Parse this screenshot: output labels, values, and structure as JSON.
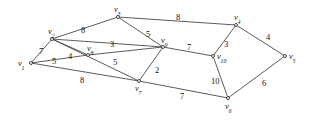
{
  "figure": {
    "type": "weighted-undirected-graph",
    "background_color": "#ffffff",
    "edge_color": "#4a4a4a",
    "label_color": "#111111",
    "width": 311,
    "height": 120
  },
  "chart_data": {
    "type": "diagram",
    "title": "",
    "xlabel": "",
    "ylabel": "",
    "graph_kind": "weighted undirected graph",
    "vertex_count": 10,
    "edge_count": 17,
    "vertices": [
      {
        "id": "v1",
        "label": "v",
        "sub": "1",
        "x": 31,
        "y": 63
      },
      {
        "id": "v2",
        "label": "v",
        "sub": "2",
        "x": 52,
        "y": 39
      },
      {
        "id": "v3",
        "label": "v",
        "sub": "3",
        "x": 118,
        "y": 17
      },
      {
        "id": "v4",
        "label": "v",
        "sub": "4",
        "x": 236,
        "y": 25
      },
      {
        "id": "v5",
        "label": "v",
        "sub": "5",
        "x": 285,
        "y": 56
      },
      {
        "id": "v6",
        "label": "v",
        "sub": "6",
        "x": 228,
        "y": 98
      },
      {
        "id": "v7",
        "label": "v",
        "sub": "7",
        "x": 139,
        "y": 81
      },
      {
        "id": "v8",
        "label": "v",
        "sub": "8",
        "x": 88,
        "y": 55
      },
      {
        "id": "v9",
        "label": "v",
        "sub": "9",
        "x": 163,
        "y": 47
      },
      {
        "id": "v10",
        "label": "v",
        "sub": "10",
        "x": 213,
        "y": 56
      }
    ],
    "vertex_label_offsets": {
      "v1": {
        "dx": -13,
        "dy": -4
      },
      "v2": {
        "dx": -4,
        "dy": -12
      },
      "v3": {
        "dx": -4,
        "dy": -12
      },
      "v4": {
        "dx": -2,
        "dy": -12
      },
      "v5": {
        "dx": 4,
        "dy": -4
      },
      "v6": {
        "dx": -3,
        "dy": 4
      },
      "v7": {
        "dx": -4,
        "dy": 3
      },
      "v8": {
        "dx": -1,
        "dy": -11
      },
      "v9": {
        "dx": -2,
        "dy": -11
      },
      "v10": {
        "dx": 4,
        "dy": -4
      }
    },
    "edges": [
      {
        "from": "v1",
        "to": "v2",
        "weight": 7,
        "lx": 39,
        "ly": 47
      },
      {
        "from": "v1",
        "to": "v8",
        "weight": 5,
        "lx": 52,
        "ly": 57
      },
      {
        "from": "v1",
        "to": "v7",
        "weight": 8,
        "lx": 80,
        "ly": 76
      },
      {
        "from": "v2",
        "to": "v3",
        "weight": 8,
        "lx": 81,
        "ly": 26
      },
      {
        "from": "v2",
        "to": "v8",
        "weight": 4,
        "lx": 68,
        "ly": 52
      },
      {
        "from": "v2",
        "to": "v9",
        "weight": 3,
        "lx": 110,
        "ly": 40
      },
      {
        "from": "v2",
        "to": "v7",
        "weight": 5,
        "lx": 113,
        "ly": 58
      },
      {
        "from": "v3",
        "to": "v9",
        "weight": 5,
        "lx": 146,
        "ly": 30
      },
      {
        "from": "v3",
        "to": "v4",
        "weight": 8,
        "lx": 176,
        "ly": 13
      },
      {
        "from": "v8",
        "to": "v9",
        "weight": null,
        "lx": null,
        "ly": null
      },
      {
        "from": "v9",
        "to": "v7",
        "weight": 2,
        "lx": 155,
        "ly": 66
      },
      {
        "from": "v9",
        "to": "v10",
        "weight": 7,
        "lx": 187,
        "ly": 43
      },
      {
        "from": "v4",
        "to": "v10",
        "weight": 3,
        "lx": 224,
        "ly": 40
      },
      {
        "from": "v4",
        "to": "v5",
        "weight": 4,
        "lx": 266,
        "ly": 33
      },
      {
        "from": "v10",
        "to": "v6",
        "weight": 10,
        "lx": 211,
        "ly": 77
      },
      {
        "from": "v7",
        "to": "v6",
        "weight": 7,
        "lx": 180,
        "ly": 92
      },
      {
        "from": "v6",
        "to": "v5",
        "weight": 6,
        "lx": 262,
        "ly": 79
      }
    ]
  }
}
